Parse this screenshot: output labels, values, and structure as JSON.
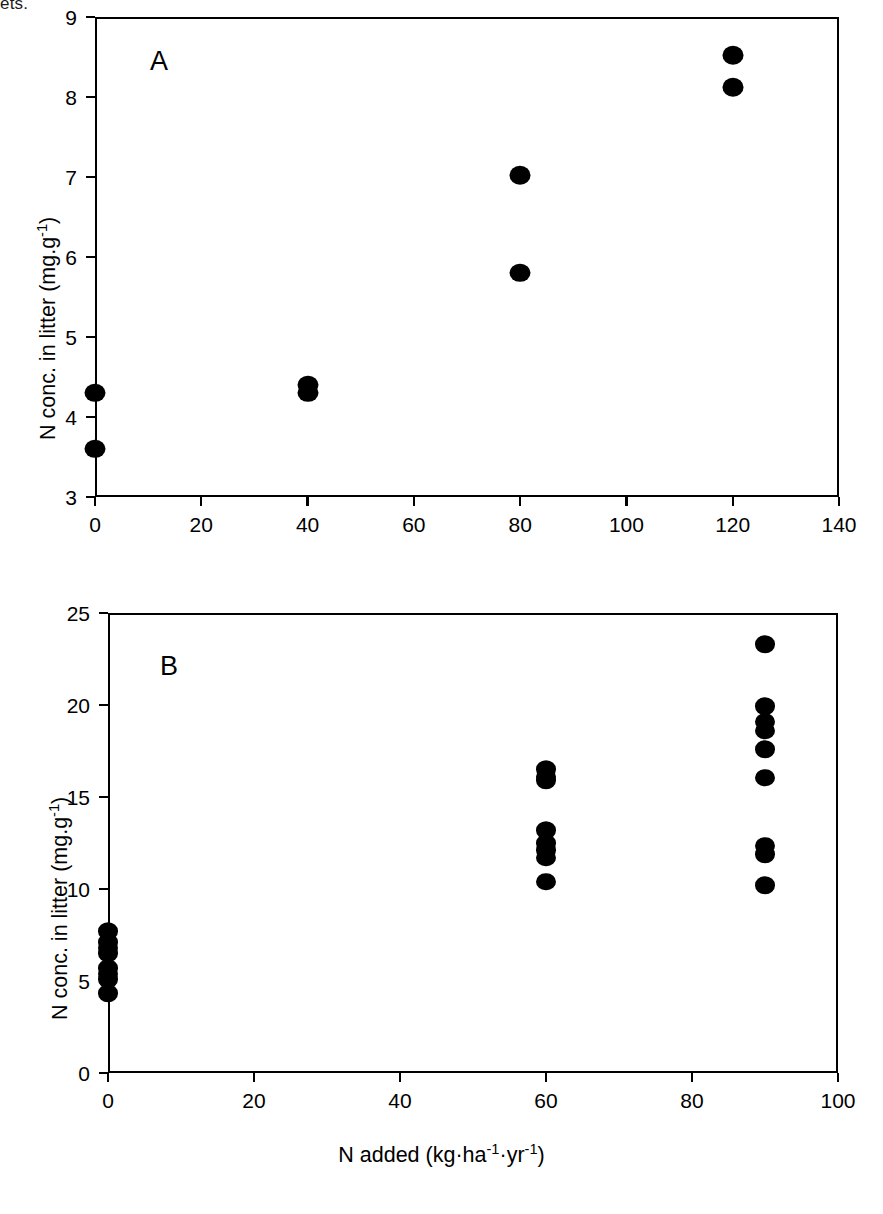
{
  "figure": {
    "stray_text_top": "ets.",
    "axis_title_y": "N conc. in litter (mg.g",
    "axis_title_y_sup": "-1",
    "axis_title_y_tail": ")",
    "axis_title_x": "N added (kg·ha",
    "axis_title_x_sup1": "-1",
    "axis_title_x_mid": "·yr",
    "axis_title_x_sup2": "-1",
    "axis_title_x_tail": ")",
    "marker_color": "#000000",
    "axis_color": "#000000",
    "background_color": "#ffffff"
  },
  "panel_a": {
    "letter": "A",
    "y_ticks": [
      "3",
      "4",
      "5",
      "6",
      "7",
      "8",
      "9"
    ],
    "x_ticks": [
      "0",
      "20",
      "40",
      "60",
      "80",
      "100",
      "120",
      "140"
    ]
  },
  "panel_b": {
    "letter": "B",
    "y_ticks": [
      "0",
      "5",
      "10",
      "15",
      "20",
      "25"
    ],
    "x_ticks": [
      "0",
      "20",
      "40",
      "60",
      "80",
      "100"
    ]
  },
  "chart_data": [
    {
      "type": "scatter",
      "panel": "A",
      "title": "",
      "xlabel": "N added (kg·ha-1·yr-1)",
      "ylabel": "N conc. in litter (mg.g-1)",
      "xlim": [
        0,
        140
      ],
      "ylim": [
        3,
        9
      ],
      "xticks": [
        0,
        20,
        40,
        60,
        80,
        100,
        120,
        140
      ],
      "yticks": [
        3,
        4,
        5,
        6,
        7,
        8,
        9
      ],
      "grid": false,
      "legend": false,
      "series": [
        {
          "name": "N conc. in litter",
          "marker": "filled-circle",
          "color": "#000000",
          "points": [
            {
              "x": 0,
              "y": 4.3
            },
            {
              "x": 0,
              "y": 3.6
            },
            {
              "x": 40,
              "y": 4.4
            },
            {
              "x": 40,
              "y": 4.3
            },
            {
              "x": 80,
              "y": 7.02
            },
            {
              "x": 80,
              "y": 5.8
            },
            {
              "x": 120,
              "y": 8.52
            },
            {
              "x": 120,
              "y": 8.12
            }
          ]
        }
      ]
    },
    {
      "type": "scatter",
      "panel": "B",
      "title": "",
      "xlabel": "N added (kg·ha-1·yr-1)",
      "ylabel": "N conc. in litter (mg.g-1)",
      "xlim": [
        0,
        100
      ],
      "ylim": [
        0,
        25
      ],
      "xticks": [
        0,
        20,
        40,
        60,
        80,
        100
      ],
      "yticks": [
        0,
        5,
        10,
        15,
        20,
        25
      ],
      "grid": false,
      "legend": false,
      "series": [
        {
          "name": "N conc. in litter",
          "marker": "filled-circle",
          "color": "#000000",
          "points": [
            {
              "x": 0,
              "y": 7.7
            },
            {
              "x": 0,
              "y": 7.1
            },
            {
              "x": 0,
              "y": 6.8
            },
            {
              "x": 0,
              "y": 6.5
            },
            {
              "x": 0,
              "y": 5.7
            },
            {
              "x": 0,
              "y": 5.4
            },
            {
              "x": 0,
              "y": 5.1
            },
            {
              "x": 0,
              "y": 4.35
            },
            {
              "x": 60,
              "y": 16.5
            },
            {
              "x": 60,
              "y": 16.1
            },
            {
              "x": 60,
              "y": 15.9
            },
            {
              "x": 60,
              "y": 13.2
            },
            {
              "x": 60,
              "y": 12.5
            },
            {
              "x": 60,
              "y": 12.1
            },
            {
              "x": 60,
              "y": 11.7
            },
            {
              "x": 60,
              "y": 10.4
            },
            {
              "x": 90,
              "y": 23.3
            },
            {
              "x": 90,
              "y": 19.95
            },
            {
              "x": 90,
              "y": 19.1
            },
            {
              "x": 90,
              "y": 18.6
            },
            {
              "x": 90,
              "y": 17.6
            },
            {
              "x": 90,
              "y": 16.05
            },
            {
              "x": 90,
              "y": 12.35
            },
            {
              "x": 90,
              "y": 11.9
            },
            {
              "x": 90,
              "y": 10.2
            }
          ]
        }
      ]
    }
  ]
}
